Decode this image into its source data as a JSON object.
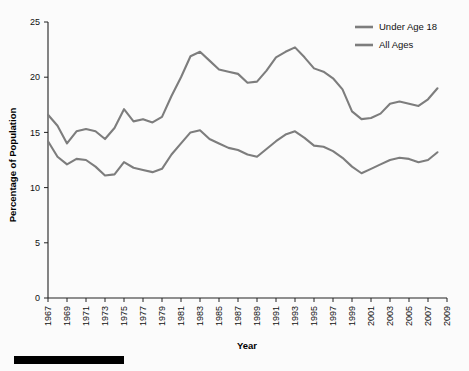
{
  "chart_data": {
    "type": "line",
    "title": "",
    "xlabel": "Year",
    "ylabel": "Percentage of Population",
    "xlim": [
      1967,
      2009
    ],
    "ylim": [
      0,
      25
    ],
    "grid": false,
    "legend_position": "top-right",
    "y_ticks": [
      0,
      5,
      10,
      15,
      20,
      25
    ],
    "y_tick_labels": [
      "0",
      "5",
      "10",
      "15",
      "20",
      "25"
    ],
    "x_ticks": [
      1967,
      1969,
      1971,
      1973,
      1975,
      1977,
      1979,
      1981,
      1983,
      1985,
      1987,
      1989,
      1991,
      1993,
      1995,
      1997,
      1999,
      2001,
      2003,
      2005,
      2007,
      2009
    ],
    "x_tick_labels": [
      "1967",
      "1969",
      "1971",
      "1973",
      "1975",
      "1977",
      "1979",
      "1981",
      "1983",
      "1985",
      "1987",
      "1989",
      "1991",
      "1993",
      "1995",
      "1997",
      "1999",
      "2001",
      "2003",
      "2005",
      "2007",
      "2009"
    ],
    "x": [
      1967,
      1968,
      1969,
      1970,
      1971,
      1972,
      1973,
      1974,
      1975,
      1976,
      1977,
      1978,
      1979,
      1980,
      1981,
      1982,
      1983,
      1984,
      1985,
      1986,
      1987,
      1988,
      1989,
      1990,
      1991,
      1992,
      1993,
      1994,
      1995,
      1996,
      1997,
      1998,
      1999,
      2000,
      2001,
      2002,
      2003,
      2004,
      2005,
      2006,
      2007,
      2008
    ],
    "series": [
      {
        "name": "Under Age 18",
        "color": "#7d7d7d",
        "values": [
          16.6,
          15.6,
          14.0,
          15.1,
          15.3,
          15.1,
          14.4,
          15.4,
          17.1,
          16.0,
          16.2,
          15.9,
          16.4,
          18.3,
          20.0,
          21.9,
          22.3,
          21.5,
          20.7,
          20.5,
          20.3,
          19.5,
          19.6,
          20.6,
          21.8,
          22.3,
          22.7,
          21.8,
          20.8,
          20.5,
          19.9,
          18.9,
          16.9,
          16.2,
          16.3,
          16.7,
          17.6,
          17.8,
          17.6,
          17.4,
          18.0,
          19.0
        ],
        "final_value": 19.0
      },
      {
        "name": "All Ages",
        "color": "#7d7d7d",
        "values": [
          14.2,
          12.8,
          12.1,
          12.6,
          12.5,
          11.9,
          11.1,
          11.2,
          12.3,
          11.8,
          11.6,
          11.4,
          11.7,
          13.0,
          14.0,
          15.0,
          15.2,
          14.4,
          14.0,
          13.6,
          13.4,
          13.0,
          12.8,
          13.5,
          14.2,
          14.8,
          15.1,
          14.5,
          13.8,
          13.7,
          13.3,
          12.7,
          11.9,
          11.3,
          11.7,
          12.1,
          12.5,
          12.7,
          12.6,
          12.3,
          12.5,
          13.2
        ],
        "final_value": 13.2
      }
    ]
  },
  "legend": {
    "items": [
      {
        "label": "Under Age 18"
      },
      {
        "label": "All Ages"
      }
    ]
  },
  "axes": {
    "y_title": "Percentage of Population",
    "x_title": "Year"
  },
  "colors": {
    "line": "#7d7d7d",
    "axis": "#222222",
    "text": "#111111",
    "bar": "#000000",
    "background": "#fbfbfb"
  }
}
